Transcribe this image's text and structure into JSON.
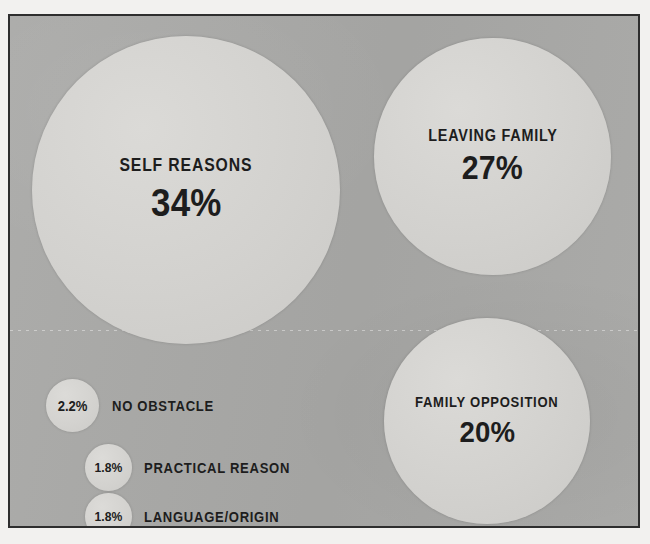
{
  "chart_data": {
    "type": "bubble",
    "title": "",
    "subtitle": "",
    "xlabel": "",
    "ylabel": "",
    "grid": false,
    "legend_position": "inline",
    "unit": "%",
    "categories": [
      "SELF REASONS",
      "LEAVING FAMILY",
      "FAMILY OPPOSITION",
      "NO OBSTACLE",
      "PRACTICAL REASON",
      "LANGUAGE/ORIGIN"
    ],
    "values": [
      34,
      27,
      20,
      2.2,
      1.8,
      1.8
    ],
    "value_labels": [
      "34%",
      "27%",
      "20%",
      "2.2%",
      "1.8%",
      "1.8%"
    ],
    "series": [
      {
        "name": "Share of responses",
        "values": [
          34,
          27,
          20,
          2.2,
          1.8,
          1.8
        ]
      }
    ]
  },
  "colors": {
    "background": "#a9a9a7",
    "bubble": "#d3d2cf",
    "text": "#1d1d1d",
    "frame": "#2e2e2e",
    "page": "#f2f1ef"
  },
  "bubbles": [
    {
      "label": "SELF REASONS",
      "value": "34%"
    },
    {
      "label": "LEAVING FAMILY",
      "value": "27%"
    },
    {
      "label": "FAMILY OPPOSITION",
      "value": "20%"
    }
  ],
  "legend": [
    {
      "value": "2.2%",
      "label": "NO OBSTACLE"
    },
    {
      "value": "1.8%",
      "label": "PRACTICAL REASON"
    },
    {
      "value": "1.8%",
      "label": "LANGUAGE/ORIGIN"
    }
  ]
}
